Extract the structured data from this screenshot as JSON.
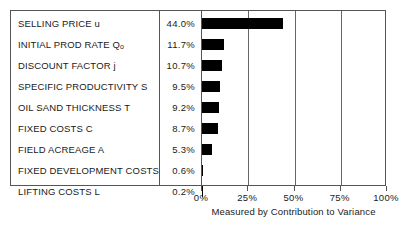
{
  "chart_data": {
    "type": "bar",
    "orientation": "horizontal",
    "title": "",
    "xlabel": "Measured by Contribution to Variance",
    "ylabel": "",
    "xlim": [
      0,
      100
    ],
    "xticks": [
      0,
      25,
      50,
      75,
      100
    ],
    "xticklabels": [
      "0%",
      "25%",
      "50%",
      "75%",
      "100%"
    ],
    "grid": true,
    "legend": null,
    "value_suffix": "%",
    "categories": [
      "SELLING PRICE u",
      "INITIAL PROD RATE Qo",
      "DISCOUNT FACTOR j",
      "SPECIFIC PRODUCTIVITY S",
      "OIL SAND THICKNESS T",
      "FIXED COSTS C",
      "FIELD ACREAGE A",
      "FIXED DEVELOPMENT COSTS",
      "LIFTING COSTS L"
    ],
    "values": [
      44.0,
      11.7,
      10.7,
      9.5,
      9.2,
      8.7,
      5.3,
      0.6,
      0.2
    ],
    "value_labels": [
      "44.0%",
      "11.7%",
      "10.7%",
      "9.5%",
      "9.2%",
      "8.7%",
      "5.3%",
      "0.6%",
      "0.2%"
    ],
    "bar_color": "#000000"
  },
  "table": {
    "rows": [
      {
        "label_main": "SELLING PRICE u",
        "label_sub": "",
        "value": "44.0%",
        "amount": 44.0
      },
      {
        "label_main": "INITIAL PROD RATE Q",
        "label_sub": "o",
        "value": "11.7%",
        "amount": 11.7
      },
      {
        "label_main": "DISCOUNT FACTOR j",
        "label_sub": "",
        "value": "10.7%",
        "amount": 10.7
      },
      {
        "label_main": "SPECIFIC PRODUCTIVITY S",
        "label_sub": "",
        "value": "9.5%",
        "amount": 9.5
      },
      {
        "label_main": "OIL SAND THICKNESS T",
        "label_sub": "",
        "value": "9.2%",
        "amount": 9.2
      },
      {
        "label_main": "FIXED COSTS C",
        "label_sub": "",
        "value": "8.7%",
        "amount": 8.7
      },
      {
        "label_main": "FIELD ACREAGE A",
        "label_sub": "",
        "value": "5.3%",
        "amount": 5.3
      },
      {
        "label_main": "FIXED DEVELOPMENT COSTS",
        "label_sub": "",
        "value": "0.6%",
        "amount": 0.6
      },
      {
        "label_main": "LIFTING COSTS L",
        "label_sub": "",
        "value": "0.2%",
        "amount": 0.2
      }
    ]
  },
  "axis": {
    "ticklabels": [
      "0%",
      "25%",
      "50%",
      "75%",
      "100%"
    ],
    "tickvalues": [
      0,
      25,
      50,
      75,
      100
    ],
    "caption": "Measured by Contribution to Variance"
  },
  "colors": {
    "bar": "#000000",
    "frame": "#555555",
    "grid": "#666666",
    "text": "#1a1a1a",
    "background": "#ffffff"
  }
}
